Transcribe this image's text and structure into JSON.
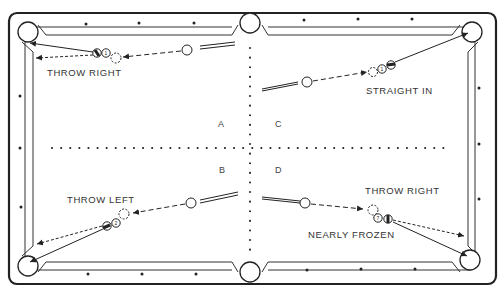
{
  "diagram": {
    "quadrants": [
      {
        "id": "A",
        "label": "A"
      },
      {
        "id": "B",
        "label": "B"
      },
      {
        "id": "C",
        "label": "C"
      },
      {
        "id": "D",
        "label": "D"
      }
    ],
    "shots": [
      {
        "quadrant": "A",
        "caption": "THROW RIGHT",
        "object_ball_number": "1"
      },
      {
        "quadrant": "C",
        "caption": "STRAIGHT IN",
        "object_ball_number": "1"
      },
      {
        "quadrant": "B",
        "caption": "THROW LEFT",
        "object_ball_number": "2"
      },
      {
        "quadrant": "D",
        "caption": "THROW RIGHT",
        "subcaption": "NEARLY FROZEN",
        "object_ball_number": "7"
      }
    ],
    "colors": {
      "line": "#222222",
      "background": "#ffffff"
    }
  }
}
